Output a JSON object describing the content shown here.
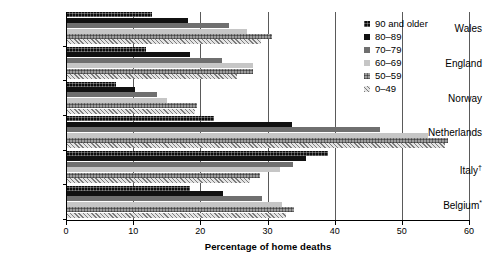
{
  "chart_data": {
    "type": "bar",
    "orientation": "horizontal",
    "title": "",
    "xlabel": "Percentage of home deaths",
    "ylabel": "",
    "xlim": [
      0,
      60
    ],
    "xticks": [
      0,
      10,
      20,
      30,
      40,
      50,
      60
    ],
    "grid": true,
    "grid_axis": "x",
    "legend_position": "top-right",
    "categories": [
      "Wales",
      "England",
      "Norway",
      "Netherlands",
      "Italy†",
      "Belgium*"
    ],
    "series": [
      {
        "name": "90 and older",
        "color": "#0c0c0c",
        "values": [
          12.8,
          11.9,
          7.4,
          22.0,
          39.0,
          18.5
        ]
      },
      {
        "name": "80–89",
        "color": "#111111",
        "values": [
          18.2,
          18.5,
          10.3,
          33.6,
          35.8,
          23.4
        ]
      },
      {
        "name": "70–79",
        "color": "#6f6f6f",
        "values": [
          24.3,
          23.2,
          13.5,
          46.7,
          33.8,
          29.2
        ]
      },
      {
        "name": "60–69",
        "color": "#c6c6c6",
        "values": [
          27.0,
          27.8,
          15.0,
          53.9,
          31.8,
          32.1
        ]
      },
      {
        "name": "50–59",
        "color": "#9e9e9e",
        "values": [
          30.6,
          27.8,
          19.5,
          56.9,
          28.9,
          33.9
        ]
      },
      {
        "name": "0–49",
        "color": "#e4e4e4",
        "values": [
          29.0,
          25.4,
          19.2,
          56.4,
          27.4,
          32.8
        ]
      }
    ]
  },
  "legend": {
    "items": [
      {
        "label": "90 and older"
      },
      {
        "label": "80–89"
      },
      {
        "label": "70–79"
      },
      {
        "label": "60–69"
      },
      {
        "label": "50–59"
      },
      {
        "label": "0–49"
      }
    ]
  },
  "axis": {
    "x_title": "Percentage of home deaths",
    "x_tick_labels": [
      "0",
      "10",
      "20",
      "30",
      "40",
      "50",
      "60"
    ],
    "y_tick_labels": [
      "Wales",
      "England",
      "Norway",
      "Netherlands",
      "Italy†",
      "Belgium*"
    ]
  }
}
